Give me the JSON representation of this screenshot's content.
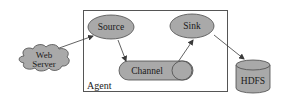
{
  "diagram": {
    "type": "flume-architecture",
    "container": {
      "label": "Agent"
    },
    "nodes": [
      {
        "id": "web_server",
        "label_lines": [
          "Web",
          "Server"
        ],
        "shape": "cloud"
      },
      {
        "id": "source",
        "label": "Source",
        "shape": "ellipse"
      },
      {
        "id": "channel",
        "label": "Channel",
        "shape": "pill"
      },
      {
        "id": "sink",
        "label": "Sink",
        "shape": "ellipse"
      },
      {
        "id": "hdfs",
        "label": "HDFS",
        "shape": "cylinder"
      }
    ],
    "edges": [
      {
        "from": "web_server",
        "to": "source"
      },
      {
        "from": "source",
        "to": "channel"
      },
      {
        "from": "channel",
        "to": "sink"
      },
      {
        "from": "sink",
        "to": "hdfs"
      }
    ],
    "colors": {
      "fill": "#a9a9a9",
      "stroke": "#4a4a4a",
      "box_stroke": "#555555",
      "text": "#1a1a1a"
    }
  }
}
